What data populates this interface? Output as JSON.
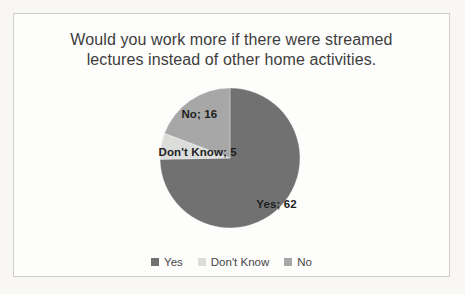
{
  "chart_data": {
    "type": "pie",
    "title": "Would you work more if there were streamed lectures instead of other home activities.",
    "title_lines": [
      "Would you work more if there were streamed",
      "lectures instead of other home activities."
    ],
    "label_format": "{name}; {value}",
    "legend_position": "bottom",
    "start_angle_deg": 0,
    "direction": "clockwise",
    "series": [
      {
        "name": "Yes",
        "value": 62,
        "color": "#717171",
        "label_text": "Yes; 62"
      },
      {
        "name": "Don't Know",
        "value": 5,
        "color": "#dcdcda",
        "label_text": "Don't Know; 5"
      },
      {
        "name": "No",
        "value": 16,
        "color": "#a7a7a7",
        "label_text": "No; 16"
      }
    ]
  }
}
